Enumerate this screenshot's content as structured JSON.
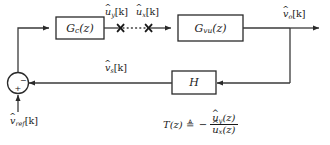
{
  "diagram": {
    "blocks": [
      {
        "id": "controller",
        "label_base": "G",
        "label_sub": "c",
        "label_arg": "(z)"
      },
      {
        "id": "plant",
        "label_base": "G",
        "label_sub": "vu",
        "label_arg": "(z)"
      },
      {
        "id": "sensor",
        "label_base": "H",
        "label_sub": "",
        "label_arg": ""
      }
    ],
    "signals": {
      "controller_output": {
        "base": "u",
        "hat": "^",
        "sub": "y",
        "index": "[k]"
      },
      "plant_input": {
        "base": "u",
        "hat": "^",
        "sub": "x",
        "index": "[k]"
      },
      "plant_output": {
        "base": "v",
        "hat": "^",
        "sub": "o",
        "index": "[k]"
      },
      "sensed": {
        "base": "v",
        "hat": "^",
        "sub": "s",
        "index": "[k]"
      },
      "reference": {
        "base": "v",
        "hat": "^",
        "sub": "ref",
        "index": "[k]"
      }
    },
    "summing_junction": {
      "name": "summing-junction",
      "sign_feedback": "−",
      "sign_reference": "+"
    },
    "break_markers": {
      "left": "✕",
      "right": "✕",
      "connector": "dotted"
    },
    "equation": {
      "lhs_base": "T",
      "lhs_arg": "(z)",
      "defined_as": "≜",
      "sign": "−",
      "numerator": {
        "base": "u",
        "hat": "^",
        "sub": "y",
        "arg": "(z)"
      },
      "denominator": {
        "base": "u",
        "hat": "^",
        "sub": "x",
        "arg": "(z)"
      }
    },
    "colors": {
      "line": "#3a3a3a",
      "text": "#1a1a1a",
      "background": "#ffffff",
      "box_fill": "#ffffff"
    }
  }
}
